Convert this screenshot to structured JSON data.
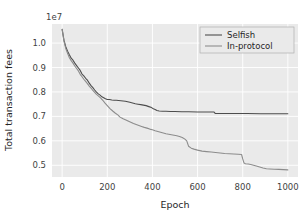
{
  "chart_data": {
    "type": "line",
    "title": "",
    "xlabel": "Epoch",
    "ylabel": "Total transaction fees",
    "y_offset_text": "1e7",
    "y_scale_multiplier": 10000000,
    "xlim": [
      -45,
      1045
    ],
    "ylim": [
      0.452,
      1.078
    ],
    "xticks": [
      0,
      200,
      400,
      600,
      800,
      1000
    ],
    "xticklabels": [
      "0",
      "200",
      "400",
      "600",
      "800",
      "1000"
    ],
    "yticks": [
      0.5,
      0.6,
      0.7,
      0.8,
      0.9,
      1.0
    ],
    "yticklabels": [
      "0.5",
      "0.6",
      "0.7",
      "0.8",
      "0.9",
      "1.0"
    ],
    "grid": true,
    "grid_color": "#ffffff",
    "plot_bgcolor": "#eaeaea",
    "figure_bgcolor": "#ffffff",
    "legend_position": "upper right",
    "legend_facecolor": "#eaeaea",
    "legend_edgecolor": "#b0b0b0",
    "series": [
      {
        "name": "Selfish",
        "color": "#4d4d4d",
        "linewidth": 1.1,
        "x": [
          0,
          8,
          16,
          24,
          32,
          40,
          48,
          56,
          64,
          72,
          80,
          88,
          96,
          104,
          112,
          120,
          128,
          136,
          144,
          152,
          160,
          168,
          176,
          184,
          192,
          200,
          210,
          220,
          230,
          240,
          250,
          260,
          270,
          280,
          290,
          300,
          312,
          324,
          336,
          348,
          360,
          372,
          384,
          396,
          404,
          412,
          420,
          430,
          445,
          460,
          480,
          500,
          530,
          560,
          600,
          640,
          672,
          678,
          700,
          760,
          820,
          880,
          940,
          1000
        ],
        "y": [
          1.056,
          1.012,
          0.985,
          0.967,
          0.952,
          0.938,
          0.93,
          0.918,
          0.908,
          0.898,
          0.888,
          0.873,
          0.866,
          0.856,
          0.848,
          0.836,
          0.826,
          0.818,
          0.808,
          0.799,
          0.792,
          0.787,
          0.78,
          0.776,
          0.772,
          0.769,
          0.769,
          0.767,
          0.766,
          0.766,
          0.765,
          0.764,
          0.763,
          0.762,
          0.76,
          0.758,
          0.755,
          0.752,
          0.75,
          0.748,
          0.746,
          0.744,
          0.74,
          0.736,
          0.731,
          0.728,
          0.724,
          0.722,
          0.721,
          0.721,
          0.72,
          0.72,
          0.719,
          0.719,
          0.718,
          0.718,
          0.718,
          0.712,
          0.712,
          0.712,
          0.712,
          0.711,
          0.711,
          0.711
        ]
      },
      {
        "name": "In-protocol",
        "color": "#8c8c8c",
        "linewidth": 1.1,
        "x": [
          0,
          8,
          16,
          24,
          32,
          40,
          48,
          56,
          64,
          72,
          80,
          88,
          96,
          104,
          112,
          120,
          128,
          136,
          144,
          152,
          160,
          170,
          180,
          190,
          200,
          212,
          224,
          236,
          248,
          255,
          262,
          270,
          280,
          292,
          304,
          316,
          328,
          340,
          352,
          364,
          376,
          388,
          400,
          412,
          424,
          436,
          448,
          460,
          472,
          484,
          496,
          508,
          520,
          532,
          544,
          552,
          560,
          572,
          584,
          600,
          620,
          640,
          660,
          680,
          700,
          720,
          740,
          760,
          780,
          795,
          800,
          806,
          812,
          824,
          836,
          848,
          860,
          875,
          890,
          905,
          920,
          940,
          960,
          980,
          1000
        ],
        "y": [
          1.056,
          1.008,
          0.978,
          0.958,
          0.94,
          0.928,
          0.918,
          0.906,
          0.896,
          0.886,
          0.872,
          0.862,
          0.852,
          0.843,
          0.834,
          0.824,
          0.816,
          0.806,
          0.798,
          0.79,
          0.784,
          0.776,
          0.766,
          0.754,
          0.744,
          0.732,
          0.722,
          0.713,
          0.705,
          0.698,
          0.694,
          0.69,
          0.686,
          0.681,
          0.676,
          0.671,
          0.667,
          0.663,
          0.659,
          0.655,
          0.652,
          0.648,
          0.645,
          0.641,
          0.638,
          0.635,
          0.632,
          0.629,
          0.627,
          0.625,
          0.623,
          0.621,
          0.618,
          0.614,
          0.607,
          0.6,
          0.578,
          0.57,
          0.566,
          0.562,
          0.558,
          0.556,
          0.554,
          0.552,
          0.55,
          0.548,
          0.547,
          0.546,
          0.545,
          0.544,
          0.526,
          0.509,
          0.506,
          0.505,
          0.503,
          0.5,
          0.497,
          0.493,
          0.489,
          0.486,
          0.485,
          0.484,
          0.483,
          0.482,
          0.481
        ]
      }
    ]
  }
}
